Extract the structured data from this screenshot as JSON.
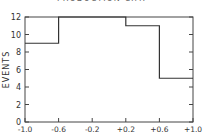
{
  "chart_data": {
    "type": "bar",
    "subtype": "histogram",
    "title": "PRODUCTION C.M.",
    "xlabel": "",
    "ylabel": "EVENTS",
    "bin_edges": [
      -1.0,
      -0.6,
      0.2,
      0.6,
      1.0
    ],
    "values": [
      9,
      12,
      11,
      5
    ],
    "xlim": [
      -1.0,
      1.0
    ],
    "ylim": [
      0,
      12
    ],
    "x_ticks": [
      "-1.0",
      "-0.6",
      "-0.2",
      "+0.2",
      "+0.6",
      "+1.0"
    ],
    "x_tick_values": [
      -1.0,
      -0.6,
      -0.2,
      0.2,
      0.6,
      1.0
    ],
    "y_ticks": [
      "0",
      "2",
      "4",
      "6",
      "8",
      "10",
      "12"
    ],
    "y_tick_values": [
      0,
      2,
      4,
      6,
      8,
      10,
      12
    ],
    "grid": false,
    "legend": null
  }
}
